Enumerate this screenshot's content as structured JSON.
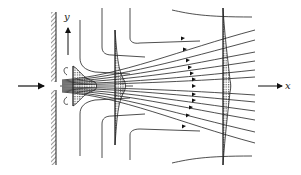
{
  "diagram": {
    "axes": {
      "x_label": "x",
      "y_label": "y"
    },
    "elements": {
      "wall": "hatched vertical wall with slot opening",
      "inflow_arrow": "arrow entering slot from left",
      "velocity_profiles": [
        {
          "position": "near slot",
          "shape": "wide, short (top-hat)"
        },
        {
          "position": "middle",
          "shape": "narrower, taller"
        },
        {
          "position": "far downstream",
          "shape": "flattest, widest spread"
        }
      ],
      "streamlines": "entrained streamlines bending from vertical into jet direction",
      "arrows_on_streamlines": true
    },
    "colors": {
      "line": "#222222",
      "background": "#ffffff"
    }
  }
}
